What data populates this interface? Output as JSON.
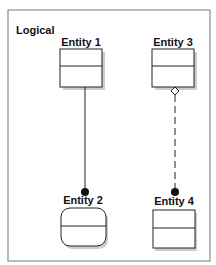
{
  "diagram": {
    "frame_label": "Logical",
    "entities": [
      {
        "id": "entity1",
        "label": "Entity 1",
        "shape": "rectangle"
      },
      {
        "id": "entity2",
        "label": "Entity 2",
        "shape": "rounded-rectangle"
      },
      {
        "id": "entity3",
        "label": "Entity 3",
        "shape": "rectangle"
      },
      {
        "id": "entity4",
        "label": "Entity 4",
        "shape": "rectangle"
      }
    ],
    "relationships": [
      {
        "from": "entity1",
        "to": "entity2",
        "line": "solid",
        "start_end": "none",
        "target_end": "filled-dot"
      },
      {
        "from": "entity3",
        "to": "entity4",
        "line": "dashed",
        "start_end": "hollow-diamond",
        "target_end": "filled-dot"
      }
    ],
    "colors": {
      "stroke": "#222222",
      "shadow": "#c8c8c8",
      "fill": "#ffffff"
    }
  }
}
